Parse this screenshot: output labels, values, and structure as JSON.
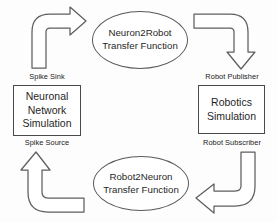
{
  "diagram": {
    "background_color": "#fdfdfd",
    "stroke_color": "#5e5e5e",
    "text_color": "#1f1f1f",
    "nodes": [
      {
        "id": "neuron2robot",
        "shape": "ellipse",
        "lines": [
          "Neuron2Robot",
          "Transfer Function"
        ]
      },
      {
        "id": "robot2neuron",
        "shape": "ellipse",
        "lines": [
          "Robot2Neuron",
          "Transfer Function"
        ]
      },
      {
        "id": "neuronal-network-simulation",
        "shape": "rectangle",
        "lines": [
          "Neuronal",
          "Network",
          "Simulation"
        ]
      },
      {
        "id": "robotics-simulation",
        "shape": "rectangle",
        "lines": [
          "Robotics",
          "Simulation"
        ]
      }
    ],
    "edges": [
      {
        "id": "spike-sink",
        "label": "Spike Sink",
        "from": "neuronal-network-simulation",
        "to": "neuron2robot",
        "direction": "up-right"
      },
      {
        "id": "robot-publisher",
        "label": "Robot Publisher",
        "from": "neuron2robot",
        "to": "robotics-simulation",
        "direction": "right-down"
      },
      {
        "id": "robot-subscriber",
        "label": "Robot Subscriber",
        "from": "robotics-simulation",
        "to": "robot2neuron",
        "direction": "down-left"
      },
      {
        "id": "spike-source",
        "label": "Spike Source",
        "from": "robot2neuron",
        "to": "neuronal-network-simulation",
        "direction": "left-up"
      }
    ]
  }
}
